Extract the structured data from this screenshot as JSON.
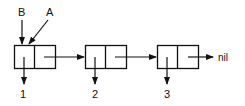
{
  "diagram": {
    "pointers": [
      {
        "label": "B",
        "target": "cell-1-car"
      },
      {
        "label": "A",
        "target": "cell-1-car"
      }
    ],
    "cells": [
      {
        "id": "cell-1",
        "car_value": "1",
        "cdr": "cell-2"
      },
      {
        "id": "cell-2",
        "car_value": "2",
        "cdr": "cell-3"
      },
      {
        "id": "cell-3",
        "car_value": "3",
        "cdr": "nil"
      }
    ],
    "terminator": "nil"
  }
}
